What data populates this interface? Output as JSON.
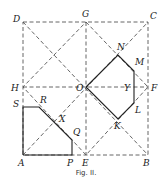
{
  "figure": {
    "caption": "Fig. II.",
    "points": {
      "A": {
        "label": "A",
        "x": 23,
        "y": 155
      },
      "B": {
        "label": "B",
        "x": 148,
        "y": 155
      },
      "C": {
        "label": "C",
        "x": 148,
        "y": 22
      },
      "D": {
        "label": "D",
        "x": 23,
        "y": 22
      },
      "E": {
        "label": "E",
        "x": 86,
        "y": 155
      },
      "F": {
        "label": "F",
        "x": 148,
        "y": 87
      },
      "G": {
        "label": "G",
        "x": 86,
        "y": 22
      },
      "H": {
        "label": "H",
        "x": 23,
        "y": 87
      },
      "O": {
        "label": "O",
        "x": 86,
        "y": 87
      },
      "N": {
        "label": "N",
        "x": 118,
        "y": 55
      },
      "M": {
        "label": "M",
        "x": 134,
        "y": 71
      },
      "Y": {
        "label": "Y",
        "x": 134,
        "y": 87
      },
      "L": {
        "label": "L",
        "x": 134,
        "y": 103
      },
      "K": {
        "label": "K",
        "x": 118,
        "y": 119
      },
      "S": {
        "label": "S",
        "x": 23,
        "y": 107
      },
      "R": {
        "label": "R",
        "x": 39,
        "y": 107
      },
      "X": {
        "label": "X",
        "x": 55,
        "y": 123
      },
      "Q": {
        "label": "Q",
        "x": 72,
        "y": 140
      },
      "P": {
        "label": "P",
        "x": 72,
        "y": 155
      }
    },
    "colors": {
      "line": "#222222",
      "dashed": "#555555",
      "background": "#ffffff"
    }
  }
}
